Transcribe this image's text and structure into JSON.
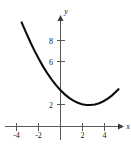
{
  "chart_data": {
    "type": "line",
    "title": "",
    "subtitle": "",
    "xlabel": "x",
    "ylabel": "y",
    "xlim": [
      -4.8,
      5.8
    ],
    "ylim": [
      -0.8,
      10.6
    ],
    "grid": false,
    "legend": null,
    "x_ticks": [
      -4,
      -2,
      2,
      4
    ],
    "x_tick_labels": [
      "-4",
      "-2",
      "2",
      "4"
    ],
    "y_ticks": [
      2,
      6,
      8
    ],
    "y_tick_labels": [
      "2",
      "6",
      "8"
    ],
    "axis_arrows": {
      "x_positive": true,
      "y_positive": true
    },
    "series": [
      {
        "name": "parabola",
        "type": "line",
        "color": "#0d0d0d",
        "vertex": [
          0.95,
          3.5
        ],
        "x": [
          -3.62,
          -3.2,
          -2.8,
          -2.4,
          -2.0,
          -1.6,
          -1.2,
          -0.8,
          -0.4,
          0.0,
          0.4,
          0.8,
          1.2,
          1.6,
          2.0,
          2.4,
          2.8,
          3.2,
          3.6,
          4.0,
          4.4,
          4.8,
          5.4
        ],
        "y": [
          9.68,
          8.73,
          7.84,
          7.01,
          6.25,
          5.55,
          4.91,
          4.34,
          3.82,
          3.37,
          2.99,
          2.66,
          2.4,
          2.21,
          2.07,
          2.0,
          2.0,
          2.05,
          2.17,
          2.35,
          2.6,
          2.9,
          3.47
        ]
      }
    ],
    "axis_label_x": "x",
    "axis_label_y": "y"
  },
  "figure": {
    "background_color": "#ffffff",
    "axis_color": "#5a5a5a",
    "curve_color": "#0d0d0d",
    "text_color": "#1a1a1a"
  }
}
